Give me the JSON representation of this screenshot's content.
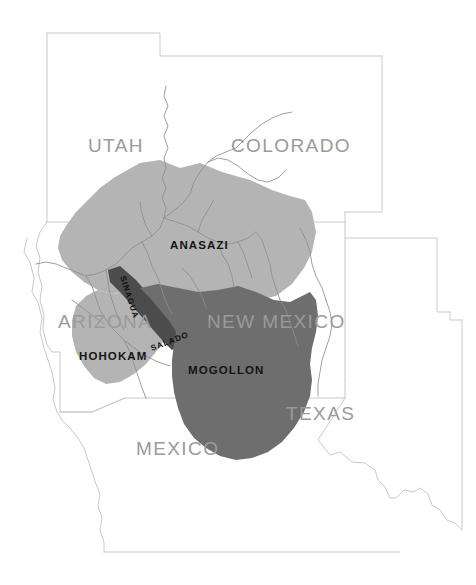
{
  "map": {
    "background_color": "#ffffff",
    "border_color": "#c9c9c9",
    "river_color": "#8d8d8d",
    "state_labels": [
      {
        "name": "utah",
        "text": "UTAH",
        "x": 88,
        "y": 152
      },
      {
        "name": "colorado",
        "text": "COLORADO",
        "x": 231,
        "y": 152
      },
      {
        "name": "arizona",
        "text": "ARIZONA",
        "x": 58,
        "y": 328
      },
      {
        "name": "new-mexico",
        "text": "NEW MEXICO",
        "x": 207,
        "y": 328
      },
      {
        "name": "texas",
        "text": "TEXAS",
        "x": 286,
        "y": 420
      },
      {
        "name": "mexico",
        "text": "MEXICO",
        "x": 136,
        "y": 455
      }
    ],
    "culture_regions": [
      {
        "name": "anasazi",
        "label": "ANASAZI",
        "color": "#b4b4b4",
        "label_x": 170,
        "label_y": 249,
        "label_rotation": 0,
        "label_size": "large"
      },
      {
        "name": "mogollon",
        "label": "MOGOLLON",
        "color": "#6e6e6e",
        "label_x": 188,
        "label_y": 374,
        "label_rotation": 0,
        "label_size": "large"
      },
      {
        "name": "hohokam",
        "label": "HOHOKAM",
        "color": "#b4b4b4",
        "label_x": 79,
        "label_y": 360,
        "label_rotation": 0,
        "label_size": "large"
      },
      {
        "name": "sinagua",
        "label": "SINAGUA",
        "color": "#4c4c4c",
        "label_x": 120,
        "label_y": 277,
        "label_rotation": 72,
        "label_size": "small"
      },
      {
        "name": "salado",
        "label": "SALADO",
        "color": "#4c4c4c",
        "label_x": 152,
        "label_y": 351,
        "label_rotation": -21,
        "label_size": "small"
      }
    ]
  }
}
